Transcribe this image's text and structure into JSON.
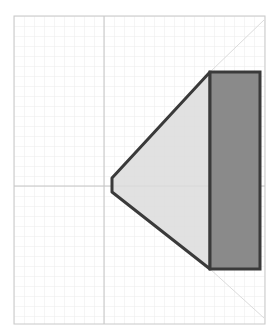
{
  "canvas": {
    "width": 276,
    "height": 334,
    "background": "#ffffff"
  },
  "frame": {
    "x": 14,
    "y": 16,
    "width": 251,
    "height": 308,
    "stroke": "#c8c8c8"
  },
  "grid": {
    "spacing": 10,
    "color": "#ececec"
  },
  "axes": {
    "origin_x": 104,
    "origin_y": 186,
    "color": "#c4c4c4"
  },
  "shapes": {
    "cone": {
      "label": "cone-trapezoid",
      "points": "112,178 210,72 210,269 112,192",
      "fill": "#dcdcdc",
      "stroke": "#3a3a3a"
    },
    "block": {
      "label": "rectangle-block",
      "x": 210,
      "y": 72,
      "width": 50,
      "height": 197,
      "fill": "#8a8a8a",
      "stroke": "#3a3a3a"
    },
    "guide_top": {
      "x1": 210,
      "y1": 72,
      "x2": 264,
      "y2": 20,
      "color": "#dcdcdc"
    },
    "guide_bottom": {
      "x1": 210,
      "y1": 269,
      "x2": 264,
      "y2": 318,
      "color": "#dcdcdc"
    }
  }
}
